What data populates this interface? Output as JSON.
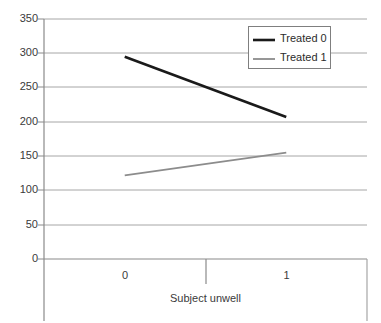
{
  "chart_data": {
    "type": "line",
    "title": "",
    "subtitle": "",
    "xlabel": "Subject unwell",
    "ylabel": "",
    "categories": [
      "0",
      "1"
    ],
    "x": [
      0,
      1
    ],
    "ylim": [
      0,
      350
    ],
    "yticks": [
      0,
      50,
      100,
      150,
      200,
      250,
      300,
      350
    ],
    "ytick_labels": [
      "0",
      "50",
      "100",
      "150",
      "200",
      "250",
      "300",
      "350"
    ],
    "grid": true,
    "grid_axis": "y",
    "legend_position": "top-right",
    "series": [
      {
        "name": "Treated 0",
        "values": [
          295,
          207
        ],
        "color": "#1a1a1a",
        "line_width": 2.6
      },
      {
        "name": "Treated 1",
        "values": [
          122,
          155
        ],
        "color": "#8c8c8c",
        "line_width": 1.8
      }
    ]
  },
  "legend": {
    "entries": [
      {
        "label": "Treated 0"
      },
      {
        "label": "Treated 1"
      }
    ]
  },
  "axes": {
    "y": {
      "labels": [
        "350",
        "300",
        "250",
        "200",
        "150",
        "100",
        "50",
        "0"
      ]
    },
    "x": {
      "labels": [
        "0",
        "1"
      ],
      "title": "Subject unwell"
    }
  },
  "colors": {
    "series_0": "#1a1a1a",
    "series_1": "#8c8c8c",
    "gridline": "#a6a6a6",
    "axis": "#8a8a8a",
    "legend_border": "#7f7f7f",
    "background": "#ffffff",
    "text": "#3a3a3a"
  }
}
